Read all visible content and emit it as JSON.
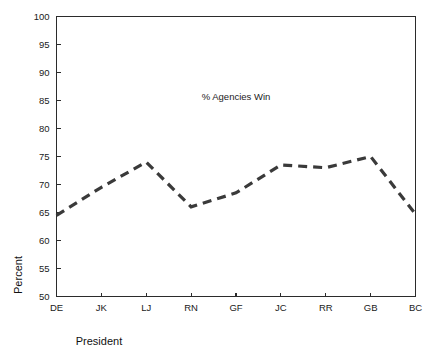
{
  "chart_data": {
    "type": "line",
    "title": "",
    "annotation": "% Agencies Win",
    "xlabel": "President",
    "ylabel": "Percent",
    "categories": [
      "DE",
      "JK",
      "LJ",
      "RN",
      "GF",
      "JC",
      "RR",
      "GB",
      "BC"
    ],
    "values": [
      64.5,
      69.5,
      74.0,
      66.0,
      68.5,
      73.5,
      73.0,
      75.0,
      64.7
    ],
    "series": [
      {
        "name": "% Agencies Win",
        "values": [
          64.5,
          69.5,
          74.0,
          66.0,
          68.5,
          73.5,
          73.0,
          75.0,
          64.7
        ]
      }
    ],
    "ylim": [
      50,
      100
    ],
    "ytick_values": [
      50,
      55,
      60,
      65,
      70,
      75,
      80,
      85,
      90,
      95,
      100
    ],
    "ytick_labels": [
      "50",
      "55",
      "60",
      "65",
      "70",
      "75",
      "80",
      "85",
      "90",
      "95",
      "100"
    ],
    "xtick_labels": [
      "DE",
      "JK",
      "LJ",
      "RN",
      "GF",
      "JC",
      "RR",
      "GB",
      "BC"
    ],
    "grid": false,
    "legend": false,
    "legend_position": "none",
    "line_style": "dashed",
    "line_color": "#3a3a3a",
    "background_color": "#ffffff",
    "axis_color": "#2b2b2b"
  }
}
